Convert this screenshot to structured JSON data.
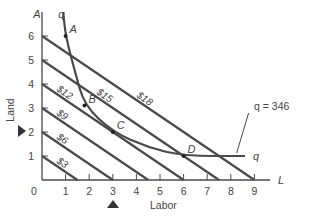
{
  "chart_data": {
    "type": "line",
    "title": "",
    "xlabel": "Labor",
    "ylabel": "Land",
    "x_axis_end_label": "L",
    "y_axis_end_label": "A",
    "xlim": [
      0,
      9.7
    ],
    "ylim": [
      0,
      7
    ],
    "x_ticks": [
      "0",
      "1",
      "2",
      "3",
      "4",
      "5",
      "6",
      "7",
      "8",
      "9"
    ],
    "y_ticks": [
      "1",
      "2",
      "3",
      "4",
      "5",
      "6"
    ],
    "grid": false,
    "isocost_lines": [
      {
        "name": "$3",
        "points": [
          [
            0,
            1
          ],
          [
            1.5,
            0
          ]
        ]
      },
      {
        "name": "$6",
        "points": [
          [
            0,
            2
          ],
          [
            3,
            0
          ]
        ]
      },
      {
        "name": "$9",
        "points": [
          [
            0,
            3
          ],
          [
            4.5,
            0
          ]
        ]
      },
      {
        "name": "$12",
        "points": [
          [
            0,
            4
          ],
          [
            6,
            0
          ]
        ]
      },
      {
        "name": "$15",
        "points": [
          [
            0,
            5
          ],
          [
            7.5,
            0
          ]
        ]
      },
      {
        "name": "$18",
        "points": [
          [
            0,
            6
          ],
          [
            9,
            0
          ]
        ]
      }
    ],
    "isoquant": {
      "name": "q = 346",
      "end_label": "q",
      "start_label": "q",
      "points": [
        [
          0.9,
          7
        ],
        [
          1,
          6
        ],
        [
          1.4,
          4.5
        ],
        [
          1.8,
          3.1
        ],
        [
          3,
          2
        ],
        [
          4.5,
          1.35
        ],
        [
          6,
          1
        ],
        [
          8.6,
          1
        ]
      ]
    },
    "labeled_points": [
      {
        "label": "A",
        "x": 1,
        "y": 6
      },
      {
        "label": "B",
        "x": 1.8,
        "y": 3.1
      },
      {
        "label": "C",
        "x": 3,
        "y": 2
      },
      {
        "label": "D",
        "x": 6,
        "y": 1
      }
    ],
    "annotations": [
      {
        "text": "q = 346",
        "points_to": [
          8.5,
          1
        ]
      },
      {
        "text": "▶",
        "at": "y=2 (left marker)"
      },
      {
        "text": "▲",
        "at": "x=3 (bottom marker)"
      }
    ],
    "colors": {
      "lines": "#4a4a4a",
      "text": "#444444",
      "background": "#ffffff"
    }
  }
}
